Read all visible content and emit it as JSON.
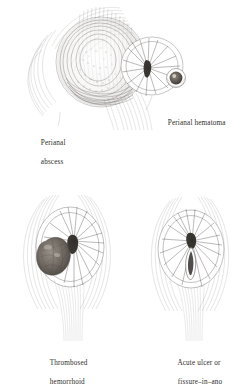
{
  "plate": {
    "title": "Perianal lesions illustration plate",
    "background_color": "#ffffff",
    "ink_color": "#4a4644",
    "text_color": "#2e2c2b",
    "style": "pen-and-ink line drawing"
  },
  "figures": [
    {
      "id": "perianal-abscess",
      "label_line1": "Perianal",
      "label_line2": "abscess",
      "label_x": 33,
      "label_y": 130,
      "description": "Large rounded swelling with dense stippled shading lateral to the anal verge"
    },
    {
      "id": "perianal-hematoma",
      "label_line1": "Perianal hematoma",
      "label_line2": "",
      "label_x": 160,
      "label_y": 112,
      "description": "Small dark rounded nodule at the anal margin"
    },
    {
      "id": "thrombosed-hemorrhoid",
      "label_line1": "Thrombosed",
      "label_line2": "hemorrhoid",
      "label_x": 42,
      "label_y": 352,
      "description": "Dark lobulated mass at the left side of the anal opening with radiating skin folds"
    },
    {
      "id": "acute-ulcer-fissure-in-ano",
      "label_line1": "Acute ulcer or",
      "label_line2": "fissure–in–ano",
      "label_x": 170,
      "label_y": 352,
      "description": "Vertical elongated slit below the anal center with radiating folds"
    }
  ]
}
